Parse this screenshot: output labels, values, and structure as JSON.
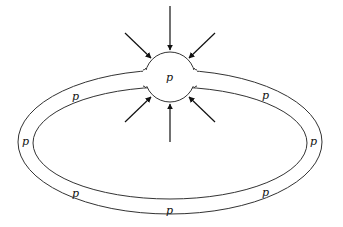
{
  "diagram": {
    "colors": {
      "stroke": "#333333",
      "background": "#ffffff",
      "arrow": "#111111"
    },
    "labels": {
      "center": "p",
      "top_left": "p",
      "top_right": "p",
      "left": "p",
      "right": "p",
      "bottom_left": "p",
      "bottom_right": "p",
      "bottom": "p"
    },
    "arrows": [
      {
        "name": "arrow-top",
        "direction": "down"
      },
      {
        "name": "arrow-top-left",
        "direction": "down-right"
      },
      {
        "name": "arrow-top-right",
        "direction": "down-left"
      },
      {
        "name": "arrow-bottom",
        "direction": "up"
      },
      {
        "name": "arrow-bottom-left",
        "direction": "up-right"
      },
      {
        "name": "arrow-bottom-right",
        "direction": "up-left"
      }
    ]
  }
}
